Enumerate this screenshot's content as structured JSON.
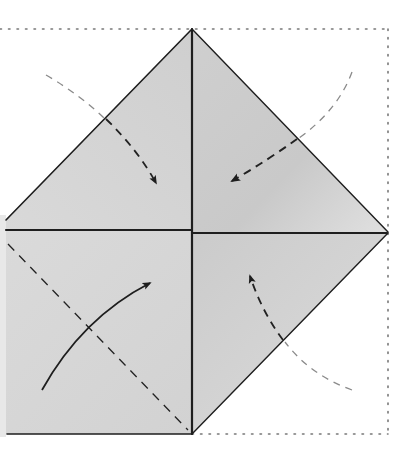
{
  "diagram": {
    "colors": {
      "background": "#ffffff",
      "paper_fill": "#d6d6d6",
      "paper_fill_light": "#e2e2e2",
      "paper_fill_dark": "#c8c8c8",
      "edge": "#1e1e1e",
      "dotted_outline": "#6e6e6e",
      "arrow_dark": "#222222",
      "arrow_light": "#8a8a8a"
    },
    "outline_square": {
      "top": 29,
      "right": 388,
      "bottom": 434,
      "left_offscreen": true
    },
    "center": {
      "x": 192,
      "y": 231
    },
    "apexes": {
      "top": [
        192,
        29
      ],
      "right": [
        388,
        232
      ],
      "bottom": [
        192,
        434
      ]
    },
    "regions": [
      {
        "name": "top-left-flap",
        "shape": "triangle"
      },
      {
        "name": "top-right-flap",
        "shape": "triangle"
      },
      {
        "name": "bottom-left-square",
        "shape": "square",
        "has_valley_fold": true
      },
      {
        "name": "bottom-right-flap",
        "shape": "triangle"
      }
    ],
    "arrows": [
      {
        "name": "fold-arrow-top-left",
        "direction": "down-right",
        "style": "dashed",
        "from": [
          48,
          75
        ],
        "to": [
          158,
          188
        ]
      },
      {
        "name": "fold-arrow-top-right",
        "direction": "down-left",
        "style": "dashed",
        "from": [
          352,
          73
        ],
        "to": [
          228,
          182
        ]
      },
      {
        "name": "fold-arrow-bottom-left",
        "direction": "up-right",
        "style": "solid",
        "from": [
          42,
          390
        ],
        "to": [
          153,
          281
        ]
      },
      {
        "name": "fold-arrow-bottom-right",
        "direction": "up-left",
        "style": "dashed",
        "from": [
          352,
          390
        ],
        "to": [
          248,
          272
        ]
      }
    ]
  }
}
